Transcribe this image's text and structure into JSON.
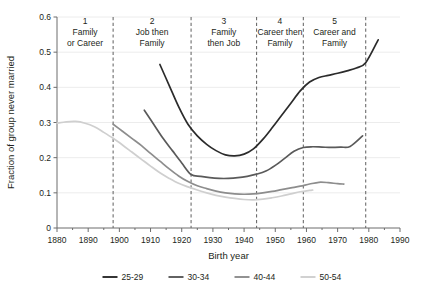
{
  "chart_data": {
    "type": "line",
    "title": "",
    "xlabel": "Birth year",
    "ylabel": "Fraction of group never married",
    "xlim": [
      1880,
      1990
    ],
    "ylim": [
      0,
      0.6
    ],
    "grid": true,
    "legend_position": "bottom",
    "xticks": [
      1880,
      1890,
      1900,
      1910,
      1920,
      1930,
      1940,
      1950,
      1960,
      1970,
      1980,
      1990
    ],
    "xtick_labels": [
      "1880",
      "1890",
      "1900",
      "1910",
      "1920",
      "1930",
      "1940",
      "1950",
      "1960",
      "1970",
      "1980",
      "1990"
    ],
    "yticks": [
      0,
      0.1,
      0.2,
      0.3,
      0.4,
      0.5,
      0.6
    ],
    "ytick_labels": [
      "0",
      "0.1",
      "0.2",
      "0.3",
      "0.4",
      "0.5",
      "0.6"
    ],
    "series": [
      {
        "name": "25-29",
        "color": "#2b2b2b",
        "x": [
          1913,
          1916,
          1919,
          1922,
          1925,
          1928,
          1931,
          1934,
          1937,
          1940,
          1943,
          1946,
          1949,
          1952,
          1955,
          1958,
          1961,
          1964,
          1967,
          1970,
          1973,
          1976,
          1979,
          1983
        ],
        "values": [
          0.465,
          0.405,
          0.345,
          0.295,
          0.262,
          0.238,
          0.22,
          0.208,
          0.205,
          0.21,
          0.225,
          0.252,
          0.285,
          0.32,
          0.355,
          0.39,
          0.415,
          0.428,
          0.434,
          0.44,
          0.447,
          0.455,
          0.47,
          0.535
        ]
      },
      {
        "name": "30-34",
        "color": "#5a5a5a",
        "x": [
          1908,
          1911,
          1914,
          1917,
          1920,
          1923,
          1926,
          1929,
          1932,
          1935,
          1938,
          1941,
          1944,
          1947,
          1950,
          1953,
          1956,
          1959,
          1962,
          1965,
          1968,
          1971,
          1974,
          1978
        ],
        "values": [
          0.335,
          0.295,
          0.255,
          0.22,
          0.185,
          0.152,
          0.147,
          0.143,
          0.141,
          0.141,
          0.143,
          0.147,
          0.153,
          0.162,
          0.178,
          0.198,
          0.218,
          0.229,
          0.231,
          0.23,
          0.229,
          0.23,
          0.232,
          0.262
        ]
      },
      {
        "name": "40-44",
        "color": "#8d8d8d",
        "x": [
          1898,
          1901,
          1904,
          1907,
          1910,
          1913,
          1916,
          1919,
          1922,
          1925,
          1928,
          1931,
          1934,
          1937,
          1940,
          1943,
          1946,
          1949,
          1952,
          1955,
          1958,
          1961,
          1964,
          1967,
          1970,
          1972
        ],
        "values": [
          0.295,
          0.275,
          0.255,
          0.235,
          0.212,
          0.19,
          0.168,
          0.148,
          0.132,
          0.12,
          0.112,
          0.105,
          0.1,
          0.097,
          0.096,
          0.097,
          0.1,
          0.104,
          0.109,
          0.114,
          0.119,
          0.125,
          0.13,
          0.129,
          0.126,
          0.125
        ]
      },
      {
        "name": "50-54",
        "color": "#cfcfcf",
        "x": [
          1880,
          1883,
          1886,
          1889,
          1892,
          1895,
          1898,
          1901,
          1904,
          1907,
          1910,
          1913,
          1916,
          1919,
          1922,
          1925,
          1928,
          1931,
          1934,
          1937,
          1940,
          1943,
          1946,
          1949,
          1952,
          1955,
          1958,
          1961,
          1962
        ],
        "values": [
          0.298,
          0.302,
          0.303,
          0.298,
          0.288,
          0.272,
          0.255,
          0.236,
          0.216,
          0.196,
          0.176,
          0.157,
          0.141,
          0.127,
          0.117,
          0.108,
          0.1,
          0.093,
          0.088,
          0.084,
          0.081,
          0.08,
          0.082,
          0.086,
          0.091,
          0.097,
          0.103,
          0.107,
          0.108
        ]
      }
    ],
    "phase_dividers": [
      1898,
      1923,
      1944,
      1959,
      1979
    ],
    "phases": [
      {
        "number": "1",
        "line1": "Family",
        "line2": "or Career",
        "start": 1880,
        "end": 1898
      },
      {
        "number": "2",
        "line1": "Job then",
        "line2": "Family",
        "start": 1898,
        "end": 1923
      },
      {
        "number": "3",
        "line1": "Family",
        "line2": "then Job",
        "start": 1923,
        "end": 1944
      },
      {
        "number": "4",
        "line1": "Career then",
        "line2": "Family",
        "start": 1944,
        "end": 1959
      },
      {
        "number": "5",
        "line1": "Career and",
        "line2": "Family",
        "start": 1959,
        "end": 1979
      }
    ],
    "legend": [
      {
        "label": "25-29",
        "color": "#2b2b2b"
      },
      {
        "label": "30-34",
        "color": "#5a5a5a"
      },
      {
        "label": "40-44",
        "color": "#8d8d8d"
      },
      {
        "label": "50-54",
        "color": "#cfcfcf"
      }
    ],
    "colors": {
      "grid": "#ececec",
      "axis": "#6d6d6d",
      "divider": "#6d6d6d",
      "text": "#231f20",
      "background": "#ffffff"
    }
  }
}
